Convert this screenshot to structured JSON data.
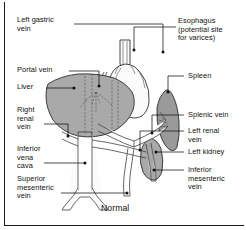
{
  "figure": {
    "caption": "Normal"
  },
  "labels_left": [
    {
      "id": "left-gastric-vein",
      "text": "Left gastric\nvein"
    },
    {
      "id": "portal-vein",
      "text": "Portal vein"
    },
    {
      "id": "liver",
      "text": "Liver"
    },
    {
      "id": "right-renal-vein",
      "text": "Right\nrenal\nvein"
    },
    {
      "id": "inferior-vena-cava",
      "text": "Inferior\nvena\ncava"
    },
    {
      "id": "superior-mesenteric-vein",
      "text": "Superior\nmesenteric\nvein"
    }
  ],
  "labels_right": [
    {
      "id": "esophagus",
      "text": "Esophagus\n(potential site\nfor varices)"
    },
    {
      "id": "spleen",
      "text": "Spleen"
    },
    {
      "id": "splenic-vein",
      "text": "Splenic vein"
    },
    {
      "id": "left-renal-vein",
      "text": "Left renal\nvein"
    },
    {
      "id": "left-kidney",
      "text": "Left kidney"
    },
    {
      "id": "inferior-mesenteric-vein",
      "text": "Inferior\nmesenteric\nvein"
    }
  ],
  "colors": {
    "organ_fill": "#a9a9a9",
    "organ_fill_dark": "#9a9a9a",
    "vessel_fill": "#fbfbfb",
    "outline": "#1a1a1a",
    "text": "#111111",
    "background": "#ffffff"
  },
  "organs": [
    {
      "id": "liver",
      "fill": "#a9a9a9"
    },
    {
      "id": "spleen",
      "fill": "#9a9a9a"
    },
    {
      "id": "left-kidney",
      "fill": "#a0a0a0"
    },
    {
      "id": "stomach",
      "fill": "#fbfbfb"
    },
    {
      "id": "esophagus",
      "fill": "#fbfbfb"
    }
  ]
}
